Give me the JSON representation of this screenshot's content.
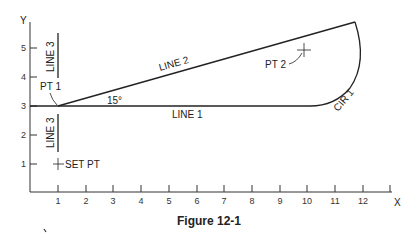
{
  "figure": {
    "caption": "Figure 12-1",
    "axes": {
      "x_label": "X",
      "y_label": "Y",
      "x_ticks": [
        "1",
        "2",
        "3",
        "4",
        "5",
        "6",
        "7",
        "8",
        "9",
        "10",
        "11",
        "12"
      ],
      "y_ticks": [
        "1",
        "2",
        "3",
        "4",
        "5"
      ]
    },
    "labels": {
      "line1": "LINE 1",
      "line2": "LINE 2",
      "line3_upper": "LINE 3",
      "line3_lower": "LINE 3",
      "pt1": "PT 1",
      "pt2": "PT 2",
      "cir1": "CIR 1",
      "set_pt": "SET PT",
      "angle": "15°"
    }
  }
}
